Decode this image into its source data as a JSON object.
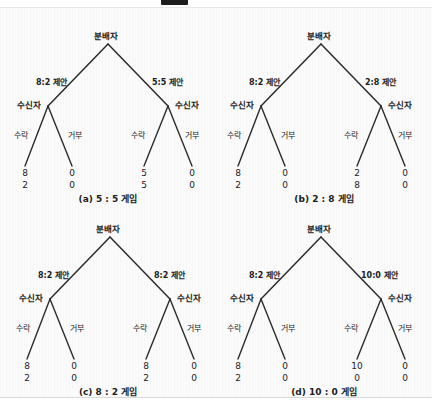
{
  "header": {
    "badge_label": "",
    "title": "",
    "visible": true
  },
  "figure": {
    "node_root_label": "분배자",
    "node_child_label": "수신자",
    "action_accept": "수락",
    "action_reject": "거부",
    "panels": [
      {
        "id": "a",
        "caption": "(a) 5 : 5 게임",
        "root": "분배자",
        "left_offer_label": "8:2 제안",
        "right_offer_label": "5:5 제안",
        "left_node": "수신자",
        "right_node": "수신자",
        "actions": [
          "수락",
          "거부",
          "수락",
          "거부"
        ],
        "payoffs": [
          {
            "top": "8",
            "bottom": "2"
          },
          {
            "top": "0",
            "bottom": "0"
          },
          {
            "top": "5",
            "bottom": "5"
          },
          {
            "top": "0",
            "bottom": "0"
          }
        ]
      },
      {
        "id": "b",
        "caption": "(b) 2 : 8 게임",
        "root": "분배자",
        "left_offer_label": "8:2 제안",
        "right_offer_label": "2:8 제안",
        "left_node": "수신자",
        "right_node": "수신자",
        "actions": [
          "수락",
          "거부",
          "수락",
          "거부"
        ],
        "payoffs": [
          {
            "top": "8",
            "bottom": "2"
          },
          {
            "top": "0",
            "bottom": "0"
          },
          {
            "top": "2",
            "bottom": "8"
          },
          {
            "top": "0",
            "bottom": "0"
          }
        ]
      },
      {
        "id": "c",
        "caption": "(c) 8 : 2 게임",
        "root": "분배자",
        "left_offer_label": "8:2 제안",
        "right_offer_label": "8:2 제안",
        "left_node": "수신자",
        "right_node": "수신자",
        "actions": [
          "수락",
          "거부",
          "수락",
          "거부"
        ],
        "payoffs": [
          {
            "top": "8",
            "bottom": "2"
          },
          {
            "top": "0",
            "bottom": "0"
          },
          {
            "top": "8",
            "bottom": "2"
          },
          {
            "top": "0",
            "bottom": "0"
          }
        ]
      },
      {
        "id": "d",
        "caption": "(d) 10 : 0 게임",
        "root": "분배자",
        "left_offer_label": "8:2 제안",
        "right_offer_label": "10:0 제안",
        "left_node": "수신자",
        "right_node": "수신자",
        "actions": [
          "수락",
          "거부",
          "수락",
          "거부"
        ],
        "payoffs": [
          {
            "top": "8",
            "bottom": "2"
          },
          {
            "top": "0",
            "bottom": "0"
          },
          {
            "top": "10",
            "bottom": "0"
          },
          {
            "top": "0",
            "bottom": "0"
          }
        ]
      }
    ]
  },
  "colors": {
    "line": "#2b2b2b",
    "text": "#1b1b1b",
    "panel_bg": "#fbfbfb",
    "page_bg": "#ffffff"
  }
}
